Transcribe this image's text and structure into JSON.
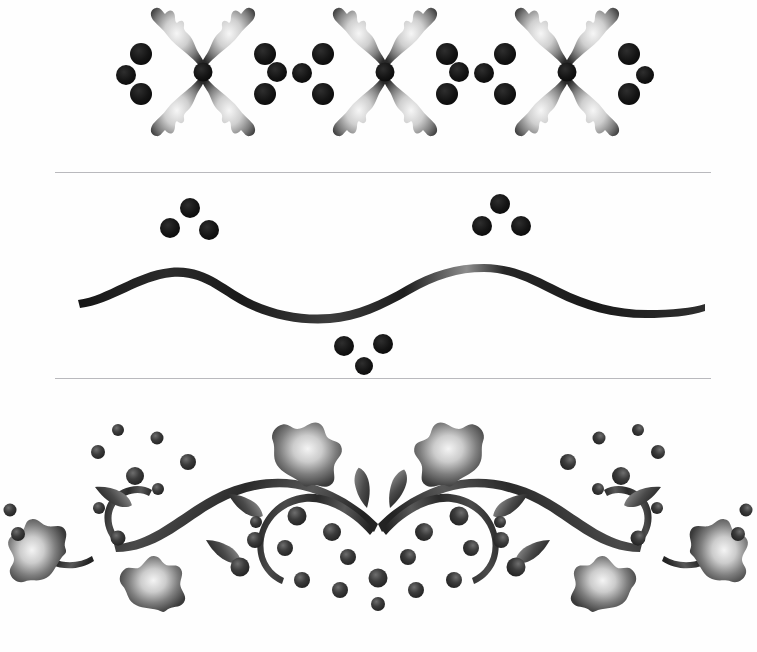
{
  "page": {
    "background_color": "#fefefe",
    "width": 757,
    "height": 652,
    "medium": "scanned stencil / airbrushed ink artwork",
    "palette": {
      "ink_dark": "#1a1a1a",
      "ink_mid": "#4a4a4a",
      "ink_light": "#9a9a9a",
      "highlight": "#f2f2f2",
      "rule_line": "#b9b9bd",
      "paper": "#fefefe"
    }
  },
  "dividers": [
    {
      "name": "divider-top",
      "y": 172,
      "x_start": 55,
      "x_end": 711,
      "color": "#b9b9bd"
    },
    {
      "name": "divider-bottom",
      "y": 378,
      "x_start": 55,
      "x_end": 711,
      "color": "#b9b9bd"
    }
  ],
  "designs": [
    {
      "id": "design-1",
      "label": "Four-Petal Flower Repeat Border",
      "description": "Three identical four-petal flowers with a center dot, four corner berries, and paired linking berries between motifs.",
      "motif_centers_x": [
        203,
        385,
        567
      ],
      "motif_center_y": 72,
      "petal_count": 4,
      "corner_dot_count": 4,
      "linking_dot_pairs": 2,
      "edge_dot_count": 2
    },
    {
      "id": "design-2",
      "label": "Undulating Wave with Berry Clusters",
      "description": "A single tapered sine-wave ribbon spanning the width, with three-berry clusters above each crest and below the trough.",
      "wave_start_x": 78,
      "wave_end_x": 705,
      "baseline_y": 272,
      "amplitude": 38,
      "crest_positions_x": [
        196,
        508
      ],
      "trough_position_x": 352,
      "clusters": [
        {
          "name": "cluster-left-crest",
          "berries": 3,
          "position": "above-crest"
        },
        {
          "name": "cluster-trough",
          "berries": 3,
          "position": "below-trough"
        },
        {
          "name": "cluster-right-crest",
          "berries": 3,
          "position": "above-crest"
        }
      ]
    },
    {
      "id": "design-3",
      "label": "Scrolled Vine with Leaves and Berries",
      "description": "Symmetrical vine: two long arching stems meeting in a central V with two small upright leaves, inward scroll curls, six large ragged leaves and scattered berry clusters.",
      "center_x": 378,
      "apex_y": 520,
      "large_leaf_count": 6,
      "small_leaf_count": 6,
      "scroll_curl_count": 4,
      "berry_count": 34,
      "symmetry": "bilateral-mirror"
    }
  ]
}
